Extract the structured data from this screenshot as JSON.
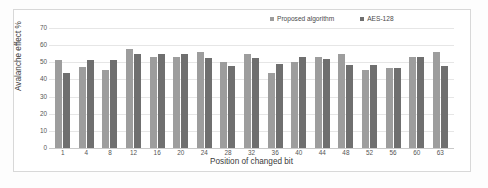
{
  "chart_data": {
    "type": "bar",
    "title": "",
    "xlabel": "Position of changed bit",
    "ylabel": "Avalanche effect %",
    "ylim": [
      0,
      70
    ],
    "ytick_step": 10,
    "yticks": [
      0,
      10,
      20,
      30,
      40,
      50,
      60,
      70
    ],
    "grid": true,
    "legend_position": "top-right",
    "categories": [
      "1",
      "4",
      "8",
      "12",
      "16",
      "20",
      "24",
      "28",
      "32",
      "36",
      "40",
      "44",
      "48",
      "52",
      "56",
      "60",
      "63"
    ],
    "series": [
      {
        "name": "Proposed algorithm",
        "color": "#9d9d9d",
        "values": [
          51.5,
          47.0,
          45.5,
          58.0,
          53.3,
          53.3,
          56.3,
          50.2,
          54.8,
          43.8,
          50.0,
          53.2,
          54.8,
          45.8,
          46.8,
          53.2,
          56.2
        ]
      },
      {
        "name": "AES-128",
        "color": "#6f6f6f",
        "values": [
          44.0,
          51.6,
          51.5,
          54.8,
          54.8,
          54.8,
          52.5,
          47.8,
          52.5,
          49.3,
          53.3,
          51.8,
          48.5,
          48.7,
          46.9,
          53.3,
          47.7
        ]
      }
    ]
  },
  "legend": {
    "entries": [
      {
        "label": "Proposed algorithm",
        "marker": "square-marker",
        "color": "#9d9d9d"
      },
      {
        "label": "AES-128",
        "marker": "square-marker",
        "color": "#6f6f6f"
      }
    ]
  },
  "axes": {
    "y_title": "Avalanche effect %",
    "x_title": "Position of changed bit",
    "y_tick_labels": [
      "70",
      "60",
      "50",
      "40",
      "30",
      "20",
      "10",
      "0"
    ],
    "x_tick_labels": [
      "1",
      "4",
      "8",
      "12",
      "16",
      "20",
      "24",
      "28",
      "32",
      "36",
      "40",
      "44",
      "48",
      "52",
      "56",
      "60",
      "63"
    ]
  }
}
